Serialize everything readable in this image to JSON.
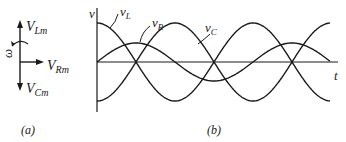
{
  "figure": {
    "panel_a": {
      "caption": "(a)",
      "omega_label": "ω",
      "phasors": [
        {
          "name": "V",
          "sub": "Lm",
          "direction": "up"
        },
        {
          "name": "V",
          "sub": "Rm",
          "direction": "right"
        },
        {
          "name": "V",
          "sub": "Cm",
          "direction": "down"
        }
      ]
    },
    "panel_b": {
      "caption": "(b)",
      "y_axis_label": "v",
      "x_axis_label": "t",
      "curves": [
        {
          "name": "v",
          "sub": "L",
          "amplitude": 0.65,
          "phase": "leads by 90°"
        },
        {
          "name": "v",
          "sub": "R",
          "amplitude": 0.4,
          "phase": "in phase"
        },
        {
          "name": "v",
          "sub": "C",
          "amplitude": 1.0,
          "phase": "lags by 90°"
        }
      ]
    }
  }
}
